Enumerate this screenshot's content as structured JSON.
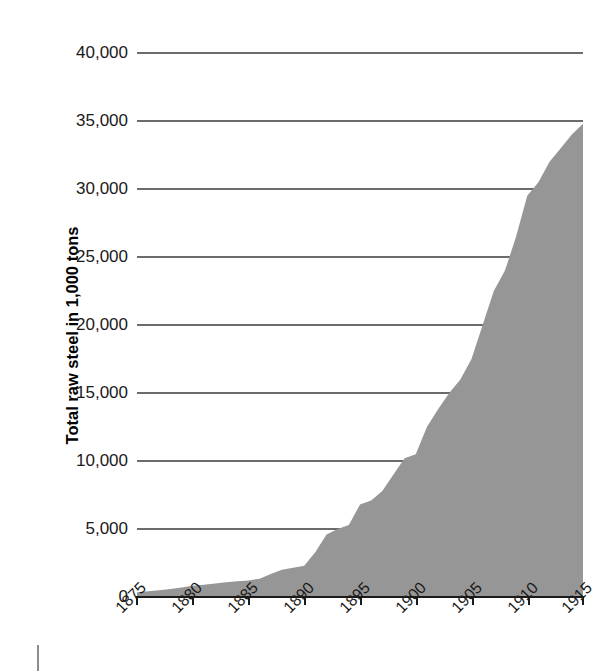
{
  "chart_data": {
    "type": "area",
    "title": "",
    "xlabel": "",
    "ylabel": "Total raw steel in 1,000 tons",
    "xlim": [
      1875,
      1915
    ],
    "ylim": [
      0,
      40000
    ],
    "grid": true,
    "legend": "none",
    "fill_color": "#969696",
    "gridline_color": "#6b6b6b",
    "axis_color": "#1a1a1a",
    "x_tick_labels": [
      "1875",
      "1880",
      "1885",
      "1890",
      "1895",
      "1900",
      "1905",
      "1910",
      "1915"
    ],
    "x_ticks": [
      1875,
      1880,
      1885,
      1890,
      1895,
      1900,
      1905,
      1910,
      1915
    ],
    "y_tick_labels": [
      "0",
      "5,000",
      "10,000",
      "15,000",
      "20,000",
      "25,000",
      "30,000",
      "35,000",
      "40,000"
    ],
    "y_ticks": [
      0,
      5000,
      10000,
      15000,
      20000,
      25000,
      30000,
      35000,
      40000
    ],
    "x": [
      1875,
      1876,
      1877,
      1878,
      1879,
      1880,
      1881,
      1882,
      1883,
      1884,
      1885,
      1886,
      1887,
      1888,
      1889,
      1890,
      1891,
      1892,
      1893,
      1894,
      1895,
      1896,
      1897,
      1898,
      1899,
      1900,
      1901,
      1902,
      1903,
      1904,
      1905,
      1906,
      1907,
      1908,
      1909,
      1910,
      1911,
      1912,
      1913,
      1914,
      1915
    ],
    "values": [
      350,
      420,
      500,
      580,
      700,
      820,
      900,
      1000,
      1080,
      1150,
      1220,
      1350,
      1700,
      2000,
      2150,
      2300,
      3300,
      4600,
      5000,
      5300,
      6800,
      7100,
      7800,
      9000,
      10200,
      10500,
      12500,
      13800,
      15000,
      16000,
      17500,
      20000,
      22500,
      24000,
      26500,
      29500,
      30500,
      32000,
      33000,
      34000,
      34800
    ],
    "series_name": "Total raw steel"
  },
  "axis": {
    "y_title": "Total raw steel in 1,000 tons"
  }
}
